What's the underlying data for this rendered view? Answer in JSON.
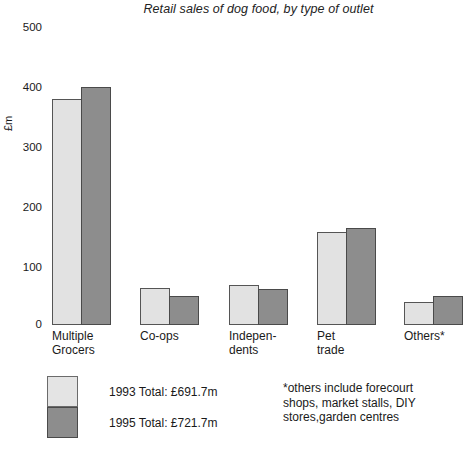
{
  "chart_data": {
    "type": "bar",
    "title": "Retail sales of dog food, by type of outlet",
    "xlabel": "",
    "ylabel": "£m",
    "ylim": [
      0,
      500
    ],
    "yticks": [
      0,
      100,
      200,
      300,
      400,
      500
    ],
    "ytick_labels": [
      "0",
      "100",
      "200",
      "300",
      "400",
      "500"
    ],
    "grid": false,
    "legend_position": "below-left",
    "categories": [
      "Multiple\nGrocers",
      "Co-ops",
      "Indepen-\ndents",
      "Pet\ntrade",
      "Others*"
    ],
    "series": [
      {
        "name": "1993 Total: £691.7m",
        "color": "#e2e2e2",
        "values": [
          377,
          62,
          67,
          155,
          38
        ]
      },
      {
        "name": "1995 Total: £721.7m",
        "color": "#8d8d8d",
        "values": [
          397,
          49,
          60,
          162,
          48
        ]
      }
    ],
    "annotations": [
      "*others include forecourt shops, market stalls, DIY stores,garden centres"
    ]
  },
  "legend": {
    "entries": [
      {
        "label": "1993 Total: £691.7m"
      },
      {
        "label": "1995 Total: £721.7m"
      }
    ]
  },
  "footnote": {
    "text": "*others include forecourt\nshops, market stalls, DIY\nstores,garden centres"
  },
  "axis": {
    "y_label": "£m",
    "y_ticks": [
      "500",
      "400",
      "300",
      "200",
      "100",
      "0"
    ]
  },
  "x_labels": [
    "Multiple\nGrocers",
    "Co-ops",
    "Indepen-\ndents",
    "Pet\ntrade",
    "Others*"
  ]
}
